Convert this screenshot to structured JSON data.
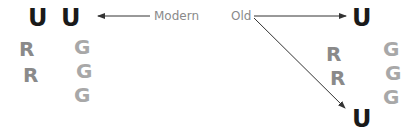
{
  "labels": {
    "modern": "Modern",
    "old": "Old"
  },
  "left_group": {
    "u_top": [
      "U",
      "U"
    ],
    "r_column": [
      "R",
      "R"
    ],
    "g_column": [
      "G",
      "G",
      "G"
    ]
  },
  "right_group": {
    "u_top": "U",
    "u_bottom": "U",
    "r_column": [
      "R",
      "R"
    ],
    "g_column": [
      "G",
      "G",
      "G"
    ]
  },
  "colors": {
    "u": "#1a1a1a",
    "r": "#8a8a8a",
    "g": "#a8a8a8",
    "label": "#8a8a8a",
    "arrow": "#333333"
  }
}
